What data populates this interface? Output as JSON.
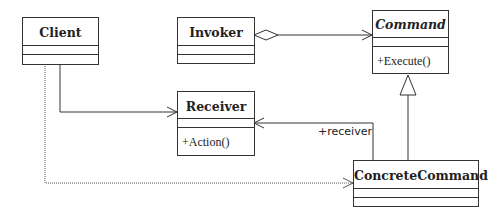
{
  "diagram": {
    "type": "uml-class-diagram",
    "classes": [
      {
        "id": "client",
        "name": "Client",
        "abstract": false,
        "operations": []
      },
      {
        "id": "invoker",
        "name": "Invoker",
        "abstract": false,
        "operations": []
      },
      {
        "id": "command",
        "name": "Command",
        "abstract": true,
        "operations": [
          "+Execute()"
        ]
      },
      {
        "id": "receiver",
        "name": "Receiver",
        "abstract": false,
        "operations": [
          "+Action()"
        ]
      },
      {
        "id": "concrete_command",
        "name": "ConcreteCommand",
        "abstract": false,
        "operations": []
      }
    ],
    "relations": [
      {
        "from": "Invoker",
        "to": "Command",
        "kind": "aggregation"
      },
      {
        "from": "Client",
        "to": "Receiver",
        "kind": "association"
      },
      {
        "from": "Client",
        "to": "ConcreteCommand",
        "kind": "dependency"
      },
      {
        "from": "ConcreteCommand",
        "to": "Receiver",
        "kind": "association",
        "label": "+receiver"
      },
      {
        "from": "ConcreteCommand",
        "to": "Command",
        "kind": "generalization"
      }
    ]
  },
  "labels": {
    "client": "Client",
    "invoker": "Invoker",
    "command": "Command",
    "command_op": "+Execute()",
    "receiver": "Receiver",
    "receiver_op": "+Action()",
    "concrete_command": "ConcreteCommand",
    "receiver_role": "+receiver"
  }
}
